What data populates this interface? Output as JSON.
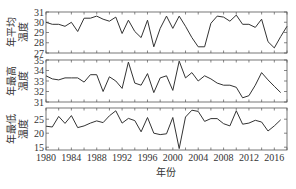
{
  "chart_data": [
    {
      "type": "line",
      "panel": "top",
      "ylabel": "年平均温度",
      "ylabel_lines": [
        "年平均",
        "温度"
      ],
      "ylim": [
        27,
        31
      ],
      "yticks": [
        27,
        28,
        29,
        30,
        31
      ],
      "x": [
        1980,
        1981,
        1982,
        1983,
        1984,
        1985,
        1986,
        1987,
        1988,
        1989,
        1990,
        1991,
        1992,
        1993,
        1994,
        1995,
        1996,
        1997,
        1998,
        1999,
        2000,
        2001,
        2002,
        2003,
        2004,
        2005,
        2006,
        2007,
        2008,
        2009,
        2010,
        2011,
        2012,
        2013,
        2014,
        2015,
        2016,
        2017,
        2018
      ],
      "values": [
        30.0,
        29.8,
        29.8,
        29.6,
        30.0,
        29.1,
        30.4,
        30.4,
        30.6,
        30.3,
        30.1,
        30.5,
        28.9,
        30.2,
        29.1,
        28.5,
        30.2,
        27.6,
        29.4,
        30.6,
        29.4,
        30.6,
        29.6,
        28.5,
        27.6,
        27.6,
        29.9,
        30.6,
        30.5,
        30.1,
        30.7,
        29.8,
        29.8,
        29.5,
        30.3,
        28.1,
        27.5,
        28.6,
        29.6,
        28.0,
        28.6,
        28.9
      ]
    },
    {
      "type": "line",
      "panel": "middle",
      "ylabel": "年最高温度",
      "ylabel_lines": [
        "年最高",
        "温度"
      ],
      "ylim": [
        31,
        35
      ],
      "yticks": [
        31,
        32,
        33,
        34,
        35
      ],
      "x": [
        1980,
        1981,
        1982,
        1983,
        1984,
        1985,
        1986,
        1987,
        1988,
        1989,
        1990,
        1991,
        1992,
        1993,
        1994,
        1995,
        1996,
        1997,
        1998,
        1999,
        2000,
        2001,
        2002,
        2003,
        2004,
        2005,
        2006,
        2007,
        2008,
        2009,
        2010,
        2011,
        2012,
        2013,
        2014,
        2015,
        2016,
        2017,
        2018
      ],
      "values": [
        33.5,
        33.2,
        33.1,
        33.3,
        33.3,
        33.3,
        32.9,
        33.6,
        33.6,
        32.0,
        33.4,
        33.0,
        32.3,
        34.8,
        32.8,
        32.6,
        33.7,
        31.9,
        33.3,
        33.5,
        32.1,
        34.9,
        33.3,
        33.8,
        33.0,
        33.5,
        33.2,
        32.8,
        32.6,
        32.6,
        32.4,
        31.4,
        31.6,
        32.6,
        33.8,
        33.1,
        32.5,
        31.9
      ]
    },
    {
      "type": "line",
      "panel": "bottom",
      "ylabel": "年最低温度",
      "ylabel_lines": [
        "年最低",
        "温度"
      ],
      "ylim": [
        14,
        29
      ],
      "yticks": [
        15,
        20,
        25
      ],
      "x": [
        1980,
        1981,
        1982,
        1983,
        1984,
        1985,
        1986,
        1987,
        1988,
        1989,
        1990,
        1991,
        1992,
        1993,
        1994,
        1995,
        1996,
        1997,
        1998,
        1999,
        2000,
        2001,
        2002,
        2003,
        2004,
        2005,
        2006,
        2007,
        2008,
        2009,
        2010,
        2011,
        2012,
        2013,
        2014,
        2015,
        2016,
        2017,
        2018
      ],
      "values": [
        22.5,
        22.2,
        26.0,
        23.5,
        26.3,
        22.0,
        22.6,
        23.6,
        24.4,
        23.8,
        26.2,
        28.0,
        23.6,
        25.3,
        24.5,
        20.5,
        25.6,
        20.0,
        19.5,
        19.8,
        25.6,
        14.5,
        25.8,
        28.2,
        27.8,
        24.2,
        25.2,
        25.2,
        23.4,
        22.6,
        28.0,
        23.2,
        23.6,
        24.6,
        24.0,
        20.8,
        22.6,
        24.8
      ]
    }
  ],
  "xaxis": {
    "label": "年份",
    "ticks": [
      1980,
      1984,
      1988,
      1992,
      1996,
      2000,
      2004,
      2008,
      2012,
      2016
    ],
    "range": [
      1980,
      2018
    ]
  },
  "panels": {
    "top": {
      "ylabel_line1": "年平均",
      "ylabel_line2": "温度"
    },
    "middle": {
      "ylabel_line1": "年最高",
      "ylabel_line2": "温度"
    },
    "bottom": {
      "ylabel_line1": "年最低",
      "ylabel_line2": "温度"
    }
  },
  "colors": {
    "line": "#333333",
    "axis": "#555555"
  }
}
